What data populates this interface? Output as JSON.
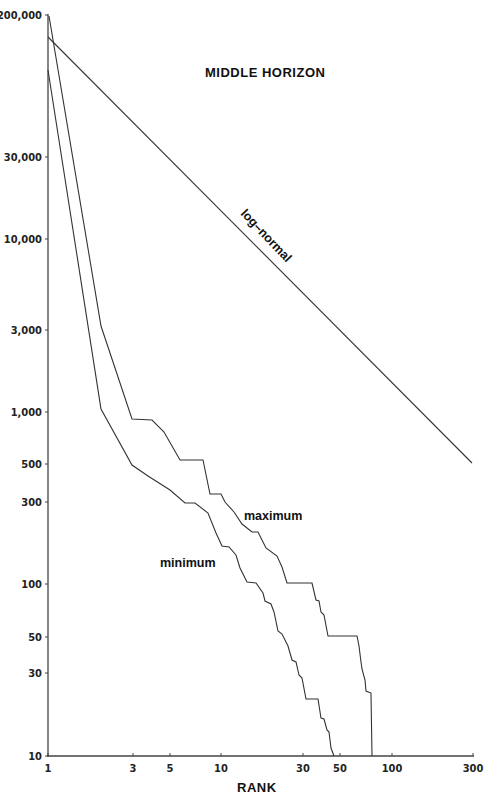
{
  "chart_data": {
    "type": "line",
    "title": "MIDDLE HORIZON",
    "xlabel": "RANK",
    "ylabel": "",
    "xscale": "log",
    "yscale": "log",
    "xlim": [
      1,
      300
    ],
    "ylim": [
      10,
      200000
    ],
    "grid": false,
    "x_ticks": [
      1,
      3,
      5,
      10,
      30,
      50,
      100,
      300
    ],
    "x_tick_labels": [
      "1",
      "3",
      "5",
      "10",
      "30",
      "50",
      "100",
      "300"
    ],
    "y_ticks": [
      10,
      30,
      50,
      100,
      300,
      500,
      1000,
      3000,
      10000,
      30000,
      200000
    ],
    "y_tick_labels": [
      "10",
      "30",
      "50",
      "100",
      "300",
      "500",
      "1,000",
      "3,000",
      "10,000",
      "30,000",
      "200,000"
    ],
    "series": [
      {
        "name": "log-normal",
        "label": "log-normal",
        "x": [
          1,
          300
        ],
        "y": [
          100000,
          500
        ]
      },
      {
        "name": "maximum",
        "label": "maximum",
        "x": [
          1,
          2,
          3,
          4,
          5,
          6,
          8,
          9,
          10,
          12,
          15,
          18,
          20,
          25,
          30,
          35,
          40,
          45,
          60,
          65,
          70,
          75,
          80
        ],
        "y": [
          200000,
          3000,
          900,
          880,
          750,
          500,
          500,
          330,
          320,
          230,
          190,
          170,
          140,
          100,
          100,
          75,
          60,
          50,
          50,
          35,
          25,
          20,
          10
        ]
      },
      {
        "name": "minimum",
        "label": "minimum",
        "x": [
          1,
          2,
          3,
          4,
          5,
          6,
          7,
          8,
          10,
          12,
          14,
          16,
          18,
          20,
          25,
          30,
          35,
          40,
          45,
          50
        ],
        "y": [
          70000,
          1400,
          480,
          360,
          300,
          250,
          250,
          200,
          130,
          100,
          90,
          75,
          55,
          45,
          35,
          30,
          25,
          18,
          14,
          10
        ]
      }
    ]
  },
  "display": {
    "title": "MIDDLE HORIZON",
    "xlabel": "RANK",
    "labels": {
      "lognormal": "log–normal",
      "maximum": "maximum",
      "minimum": "minimum"
    },
    "y_axis": [
      {
        "label": "200,000",
        "y": 15
      },
      {
        "label": "30,000",
        "y": 157
      },
      {
        "label": "10,000",
        "y": 239
      },
      {
        "label": "3,000",
        "y": 330
      },
      {
        "label": "1,000",
        "y": 412
      },
      {
        "label": "500",
        "y": 464
      },
      {
        "label": "300",
        "y": 502
      },
      {
        "label": "100",
        "y": 584
      },
      {
        "label": "50",
        "y": 637
      },
      {
        "label": "30",
        "y": 673
      },
      {
        "label": "10",
        "y": 756
      }
    ],
    "x_axis": [
      {
        "label": "1",
        "x": 48
      },
      {
        "label": "3",
        "x": 133
      },
      {
        "label": "5",
        "x": 170
      },
      {
        "label": "10",
        "x": 221
      },
      {
        "label": "30",
        "x": 303
      },
      {
        "label": "50",
        "x": 340
      },
      {
        "label": "100",
        "x": 392
      },
      {
        "label": "300",
        "x": 473
      }
    ],
    "paths": {
      "lognormal": "M48,37 L472,463",
      "maximum": "M49,16 L101,326 L132,419 L152,420 L164,432 L180,460 L203,460 L210,494 L221,494 L225,502 L234,512 L242,524 L252,532 L258,532 L266,548 L277,556 L282,567 L287,583 L312,583 L316,600 L319,601 L321,612 L324,615 L328,636 L357,636 L359,646 L361,662 L362,669 L365,680 L366,691 L371,693 L372,756",
      "minimum": "M48,70 L101,409 L132,465 L148,476 L170,490 L185,503 L195,503 L208,513 L216,533 L222,546 L229,547 L236,555 L240,568 L247,582 L256,583 L263,593 L265,601 L271,604 L274,612 L278,631 L282,634 L288,646 L292,660 L296,662 L299,675 L302,678 L306,699 L318,699 L321,718 L324,719 L327,730 L329,732 L331,748 L334,756"
    }
  }
}
